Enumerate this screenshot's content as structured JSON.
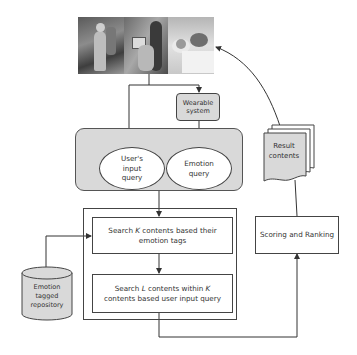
{
  "diagram": {
    "photos": [
      {
        "name": "person-with-robot"
      },
      {
        "name": "person-with-tablet"
      },
      {
        "name": "person-sleeping"
      }
    ],
    "wearable_system": "Wearable system",
    "query_group": {
      "user_input_query": "User's input query",
      "emotion_query": "Emotion query"
    },
    "search_steps": {
      "step1_prefix": "Search ",
      "step1_var": "K",
      "step1_suffix": " contents based their emotion tags",
      "step2_prefix": "Search ",
      "step2_var1": "L",
      "step2_mid": " contents within ",
      "step2_var2": "K",
      "step2_suffix": " contents based user input query"
    },
    "repository": "Emotion tagged repository",
    "result_contents": "Result contents",
    "scoring_ranking": "Scoring and Ranking",
    "colors": {
      "gray_fill": "#d9d9d9",
      "stroke": "#444444",
      "text": "#333333"
    }
  }
}
